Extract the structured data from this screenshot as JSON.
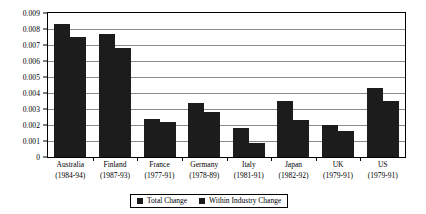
{
  "chart_data": {
    "type": "bar",
    "title": "",
    "subtitle": "",
    "xlabel": "",
    "ylabel": "",
    "ylim": [
      0,
      0.009
    ],
    "ytick_values": [
      0,
      0.001,
      0.002,
      0.003,
      0.004,
      0.005,
      0.006,
      0.007,
      0.008,
      0.009
    ],
    "ytick_labels": [
      "0",
      "0.001",
      "0.002",
      "0.003",
      "0.004",
      "0.005",
      "0.006",
      "0.007",
      "0.008",
      "0.009"
    ],
    "grid": true,
    "grid_axis": "y",
    "legend_position": "bottom",
    "bar_color": "#1c1c1c",
    "categories": [
      "Australia",
      "Finland",
      "France",
      "Germany",
      "Italy",
      "Japan",
      "UK",
      "US"
    ],
    "category_periods": [
      "(1984-94)",
      "(1987-93)",
      "(1977-91)",
      "(1978-89)",
      "(1981-91)",
      "(1982-92)",
      "(1979-91)",
      "(1979-91)"
    ],
    "series": [
      {
        "name": "Total Change",
        "values": [
          0.0083,
          0.0077,
          0.0024,
          0.0034,
          0.0018,
          0.0035,
          0.002,
          0.0043
        ]
      },
      {
        "name": "Within Industry Change",
        "values": [
          0.0075,
          0.0068,
          0.0022,
          0.0028,
          0.0009,
          0.0023,
          0.0016,
          0.0035
        ]
      }
    ]
  },
  "legend": {
    "items": [
      {
        "label": "Total Change",
        "color": "#1c1c1c"
      },
      {
        "label": "Within Industry Change",
        "color": "#1c1c1c"
      }
    ]
  }
}
